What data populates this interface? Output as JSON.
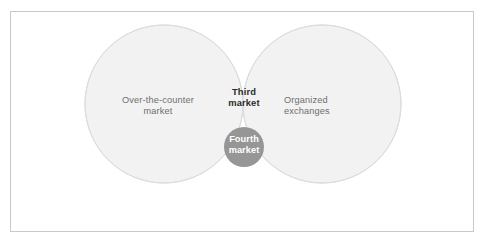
{
  "figure": {
    "type": "venn-diagram",
    "title": "",
    "background_color": "#ffffff",
    "border_color": "#c9c9c9"
  },
  "colors": {
    "circle_fill": "#f2f2f2",
    "circle_stroke": "#dcdcdc",
    "intersection_fill": "#bdbdbd",
    "inner_circle_fill": "#969696",
    "label_text": "#6e6e6e",
    "intersection_text": "#2b2b2b",
    "inner_text": "#ffffff"
  },
  "sets": {
    "left": {
      "name": "over-the-counter-market",
      "label_line1": "Over-the-counter",
      "label_line2": "market"
    },
    "right": {
      "name": "organized-exchanges",
      "label_line1": "Organized",
      "label_line2": "exchanges"
    }
  },
  "intersection": {
    "name": "third-market",
    "label_line1": "Third",
    "label_line2": "market"
  },
  "inner_region": {
    "name": "fourth-market",
    "label_line1": "Fourth",
    "label_line2": "market"
  },
  "geometry": {
    "left_circle": {
      "cx": 164,
      "cy": 104,
      "r": 79
    },
    "right_circle": {
      "cx": 322,
      "cy": 104,
      "r": 79
    },
    "inner_circle": {
      "cx": 244,
      "cy": 147,
      "r": 20
    }
  }
}
